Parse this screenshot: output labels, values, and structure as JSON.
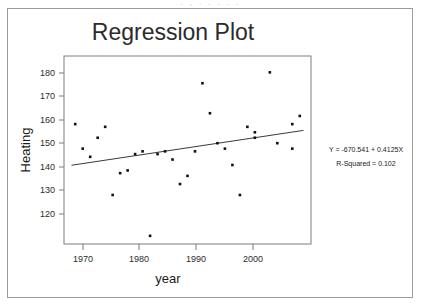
{
  "page": {
    "top_clipped_text": ". ,  . .                    . .            ."
  },
  "chart_data": {
    "type": "scatter",
    "title": "Regression Plot",
    "xlabel": "year",
    "ylabel": "Heating",
    "xlim": [
      1970.5,
      2003.5
    ],
    "ylim": [
      114,
      183
    ],
    "xticks": [
      1970,
      1980,
      1990,
      2000
    ],
    "yticks": [
      120,
      130,
      140,
      150,
      160,
      170,
      180
    ],
    "grid": false,
    "legend": "none",
    "x": [
      1972,
      1973,
      1974,
      1975,
      1976,
      1977,
      1978,
      1979,
      1980,
      1981,
      1982,
      1983,
      1984,
      1985,
      1986,
      1987,
      1988,
      1989,
      1990,
      1991,
      1992,
      1993,
      1994,
      1995,
      1996,
      1996,
      1998,
      1999,
      2001,
      2001,
      2002
    ],
    "y": [
      158,
      149,
      146,
      153,
      157,
      132,
      140,
      141,
      147,
      148,
      117,
      147,
      148,
      145,
      136,
      139,
      148,
      173,
      162,
      151,
      149,
      143,
      132,
      157,
      155,
      153,
      177,
      151,
      158,
      149,
      161
    ],
    "fit_line": {
      "slope": 0.4125,
      "intercept": -670.541,
      "x_start": 1971.5,
      "x_end": 2002.5,
      "y_start": 142.9,
      "y_end": 155.7
    },
    "annotations": [
      "Y = -670.541 + 0.4125X",
      "R-Squared = 0.102"
    ],
    "r_squared": 0.102
  },
  "axes": {
    "xtick_labels": [
      "1970",
      "1980",
      "1990",
      "2000"
    ],
    "ytick_labels": [
      "180",
      "170",
      "160",
      "150",
      "140",
      "130",
      "120"
    ]
  },
  "colors": {
    "point": "#111111",
    "line": "#3a3a3a",
    "frame": "#7d7d7d",
    "text": "#1a1a1a",
    "page_border": "#9a9a9a"
  }
}
